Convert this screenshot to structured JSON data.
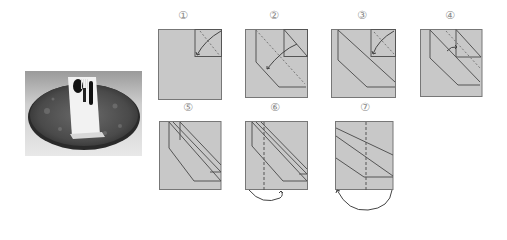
{
  "figure": {
    "photo": {
      "alt": "Folded napkin holding fork, spoon and knife on a round marble plate"
    },
    "steps": [
      {
        "number": 1,
        "label": "①"
      },
      {
        "number": 2,
        "label": "②"
      },
      {
        "number": 3,
        "label": "③"
      },
      {
        "number": 4,
        "label": "④"
      },
      {
        "number": 5,
        "label": "⑤"
      },
      {
        "number": 6,
        "label": "⑥"
      },
      {
        "number": 7,
        "label": "⑦"
      }
    ],
    "colors": {
      "paper": "#c8c8c8",
      "line": "#555555",
      "fold_line": "#777777",
      "label": "#8a8a8a"
    }
  }
}
